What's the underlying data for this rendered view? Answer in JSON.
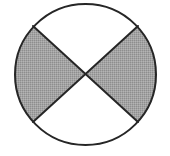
{
  "figure": {
    "name": "circle-with-two-shaded-opposite-sectors",
    "background_color": "#ffffff",
    "canvas": {
      "width": 170,
      "height": 156
    }
  },
  "circle": {
    "name": "outer-circle",
    "center_x": 85.5,
    "center_y": 74.5,
    "radius": 70.5,
    "stroke_color": "#262626",
    "stroke_width": 2,
    "fill_color": "#ffffff"
  },
  "chords": [
    {
      "name": "chord-upper-left-to-lower-right",
      "x1": 33,
      "y1": 26,
      "x2": 138,
      "y2": 122,
      "stroke_color": "#262626",
      "stroke_width": 2
    },
    {
      "name": "chord-upper-right-to-lower-left",
      "x1": 138,
      "y1": 26,
      "x2": 33,
      "y2": 122,
      "stroke_color": "#262626",
      "stroke_width": 2
    }
  ],
  "sectors": [
    {
      "name": "top-sector",
      "position": "top",
      "shaded": false,
      "fill_color": "#ffffff",
      "angle_degrees": 84,
      "path": "M 85.5 74.5 L 33 26 A 70.5 70.5 0 0 1 138 26 Z"
    },
    {
      "name": "right-sector",
      "position": "right",
      "shaded": true,
      "fill_color": "#a3a3a3",
      "angle_degrees": 96,
      "path": "M 85.5 74.5 L 138 26 A 70.5 70.5 0 0 1 138 122 Z"
    },
    {
      "name": "bottom-sector",
      "position": "bottom",
      "shaded": false,
      "fill_color": "#ffffff",
      "angle_degrees": 84,
      "path": "M 85.5 74.5 L 138 122 A 70.5 70.5 0 0 1 33 122 Z"
    },
    {
      "name": "left-sector",
      "position": "left",
      "shaded": true,
      "fill_color": "#a3a3a3",
      "angle_degrees": 96,
      "path": "M 85.5 74.5 L 33 122 A 70.5 70.5 0 0 1 33 26 Z"
    }
  ],
  "shading": {
    "name": "halftone-dither-pattern",
    "base_color": "#a3a3a3",
    "dot_color": "#8e8e8e",
    "highlight_color": "#b4b4b4",
    "tile_size": 2
  },
  "intersection_point": {
    "name": "chord-intersection-center",
    "x": 85.5,
    "y": 74.5
  },
  "labels": []
}
